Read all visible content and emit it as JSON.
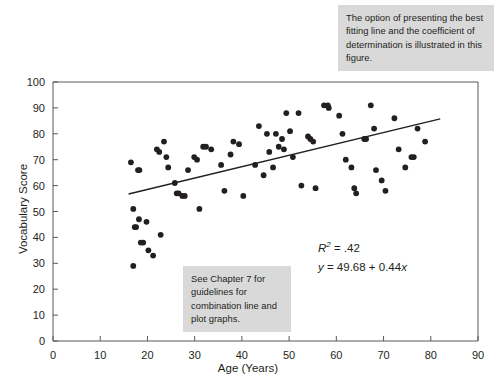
{
  "chart_data": {
    "type": "scatter",
    "title": "",
    "xlabel": "Age (Years)",
    "ylabel": "Vocabulary Score",
    "xlim": [
      0,
      90
    ],
    "ylim": [
      0,
      100
    ],
    "xticks": [
      0,
      10,
      20,
      30,
      40,
      50,
      60,
      70,
      80,
      90
    ],
    "yticks": [
      0,
      10,
      20,
      30,
      40,
      50,
      60,
      70,
      80,
      90,
      100
    ],
    "grid": false,
    "legend": null,
    "marker_color": "#231f20",
    "line_color": "#231f20",
    "regression": {
      "slope": 0.44,
      "intercept": 49.68,
      "r_squared": 0.42,
      "equation_text": "y = 49.68 + 0.44x",
      "r2_text": "R2 = .42",
      "x_start": 16,
      "x_end": 82
    },
    "points": [
      {
        "x": 16.5,
        "y": 69
      },
      {
        "x": 17.0,
        "y": 51
      },
      {
        "x": 17.3,
        "y": 44
      },
      {
        "x": 17.6,
        "y": 44
      },
      {
        "x": 17.0,
        "y": 29
      },
      {
        "x": 18.0,
        "y": 66
      },
      {
        "x": 18.3,
        "y": 66
      },
      {
        "x": 18.2,
        "y": 47
      },
      {
        "x": 18.6,
        "y": 38
      },
      {
        "x": 19.1,
        "y": 38
      },
      {
        "x": 19.8,
        "y": 46
      },
      {
        "x": 20.2,
        "y": 35
      },
      {
        "x": 21.2,
        "y": 33
      },
      {
        "x": 22.0,
        "y": 74
      },
      {
        "x": 22.5,
        "y": 73
      },
      {
        "x": 22.8,
        "y": 41
      },
      {
        "x": 23.5,
        "y": 77
      },
      {
        "x": 24.0,
        "y": 71
      },
      {
        "x": 24.4,
        "y": 67
      },
      {
        "x": 25.8,
        "y": 61
      },
      {
        "x": 26.2,
        "y": 57
      },
      {
        "x": 26.6,
        "y": 57
      },
      {
        "x": 27.4,
        "y": 56
      },
      {
        "x": 27.9,
        "y": 56
      },
      {
        "x": 28.6,
        "y": 66
      },
      {
        "x": 29.9,
        "y": 71
      },
      {
        "x": 30.5,
        "y": 70
      },
      {
        "x": 31.0,
        "y": 51
      },
      {
        "x": 31.8,
        "y": 75
      },
      {
        "x": 32.4,
        "y": 75
      },
      {
        "x": 33.5,
        "y": 74
      },
      {
        "x": 35.6,
        "y": 68
      },
      {
        "x": 36.3,
        "y": 58
      },
      {
        "x": 37.6,
        "y": 72
      },
      {
        "x": 38.2,
        "y": 77
      },
      {
        "x": 39.4,
        "y": 76
      },
      {
        "x": 40.3,
        "y": 56
      },
      {
        "x": 42.8,
        "y": 68
      },
      {
        "x": 43.6,
        "y": 83
      },
      {
        "x": 44.6,
        "y": 64
      },
      {
        "x": 45.3,
        "y": 80
      },
      {
        "x": 45.8,
        "y": 73
      },
      {
        "x": 46.6,
        "y": 67
      },
      {
        "x": 47.2,
        "y": 80
      },
      {
        "x": 47.8,
        "y": 75
      },
      {
        "x": 48.5,
        "y": 78
      },
      {
        "x": 48.9,
        "y": 74
      },
      {
        "x": 49.4,
        "y": 88
      },
      {
        "x": 50.2,
        "y": 81
      },
      {
        "x": 50.8,
        "y": 71
      },
      {
        "x": 52.0,
        "y": 88
      },
      {
        "x": 52.6,
        "y": 60
      },
      {
        "x": 54.0,
        "y": 79
      },
      {
        "x": 54.5,
        "y": 78
      },
      {
        "x": 55.1,
        "y": 77
      },
      {
        "x": 55.6,
        "y": 59
      },
      {
        "x": 57.4,
        "y": 91
      },
      {
        "x": 58.2,
        "y": 91
      },
      {
        "x": 58.4,
        "y": 90
      },
      {
        "x": 60.6,
        "y": 87
      },
      {
        "x": 61.3,
        "y": 80
      },
      {
        "x": 62.0,
        "y": 70
      },
      {
        "x": 63.2,
        "y": 67
      },
      {
        "x": 63.8,
        "y": 59
      },
      {
        "x": 64.2,
        "y": 57
      },
      {
        "x": 65.9,
        "y": 78
      },
      {
        "x": 66.3,
        "y": 78
      },
      {
        "x": 67.3,
        "y": 91
      },
      {
        "x": 68.0,
        "y": 82
      },
      {
        "x": 68.4,
        "y": 66
      },
      {
        "x": 69.6,
        "y": 62
      },
      {
        "x": 70.4,
        "y": 58
      },
      {
        "x": 72.3,
        "y": 86
      },
      {
        "x": 73.2,
        "y": 74
      },
      {
        "x": 74.6,
        "y": 67
      },
      {
        "x": 75.9,
        "y": 71
      },
      {
        "x": 76.4,
        "y": 71
      },
      {
        "x": 77.2,
        "y": 82
      },
      {
        "x": 78.8,
        "y": 77
      }
    ]
  },
  "annotations": {
    "callout_top": "The option of presenting the best fitting line and the coefficient of determination is illustrated in this figure.",
    "callout_bottom": "See Chapter 7 for guidelines for combination line and plot graphs.",
    "r2_label": "R",
    "r2_exponent": "2",
    "r2_value": " = .42",
    "equation_y": "y",
    "equation_body": " = 49.68 + 0.44",
    "equation_x": "x"
  }
}
